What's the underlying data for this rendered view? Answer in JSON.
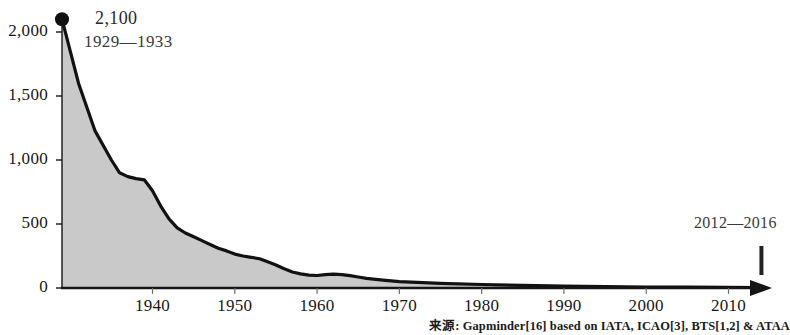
{
  "chart_data": {
    "type": "area",
    "title": "",
    "subtitle": "",
    "xlabel": "",
    "ylabel": "",
    "xlim": [
      1929,
      2016
    ],
    "ylim": [
      0,
      2200
    ],
    "grid": false,
    "legend_position": "none",
    "fill_color": "#c9c9c9",
    "line_color": "#111111",
    "axis_color": "#151515",
    "x_tick_labels": [
      "1940",
      "1950",
      "1960",
      "1970",
      "1980",
      "1990",
      "2000",
      "2010"
    ],
    "x_tick_values": [
      1940,
      1950,
      1960,
      1970,
      1980,
      1990,
      2000,
      2010
    ],
    "y_tick_labels": [
      "0",
      "500",
      "1,000",
      "1,500",
      "2,000"
    ],
    "y_tick_values": [
      0,
      500,
      1000,
      1500,
      2000
    ],
    "x": [
      1929,
      1931,
      1933,
      1935,
      1936,
      1937,
      1938,
      1939,
      1940,
      1941,
      1942,
      1943,
      1944,
      1945,
      1946,
      1947,
      1948,
      1949,
      1950,
      1951,
      1952,
      1953,
      1954,
      1955,
      1956,
      1957,
      1958,
      1959,
      1960,
      1961,
      1962,
      1963,
      1964,
      1965,
      1966,
      1968,
      1970,
      1975,
      1980,
      1985,
      1990,
      1995,
      2000,
      2005,
      2010,
      2014
    ],
    "values": [
      2100,
      1600,
      1230,
      1000,
      900,
      870,
      855,
      845,
      760,
      640,
      540,
      470,
      430,
      400,
      370,
      340,
      310,
      290,
      265,
      250,
      240,
      228,
      205,
      180,
      150,
      125,
      110,
      100,
      98,
      105,
      108,
      104,
      96,
      86,
      76,
      62,
      50,
      36,
      27,
      20,
      15,
      11,
      8,
      6,
      5,
      4
    ],
    "annotations": [
      {
        "name": "peak-label",
        "value_text": "2,100",
        "period_text": "1929—1933",
        "x": 1929,
        "y": 2100,
        "marker": "dot"
      },
      {
        "name": "end-label",
        "period_text": "2012—2016",
        "x": 2014,
        "marker": "vertical-tick"
      }
    ],
    "source_note": "来源: Gapminder[16] based on IATA, ICAO[3], BTS[1,2] & ATAA"
  },
  "axis": {
    "y_labels": [
      "2,000",
      "1,500",
      "1,000",
      "500",
      "0"
    ],
    "x_labels": [
      "1940",
      "1950",
      "1960",
      "1970",
      "1980",
      "1990",
      "2000",
      "2010"
    ]
  },
  "annotations": {
    "peak_value": "2,100",
    "peak_period": "1929—1933",
    "end_period": "2012—2016"
  },
  "footer": {
    "source": "来源: Gapminder[16] based on IATA, ICAO[3], BTS[1,2] & ATAA"
  }
}
